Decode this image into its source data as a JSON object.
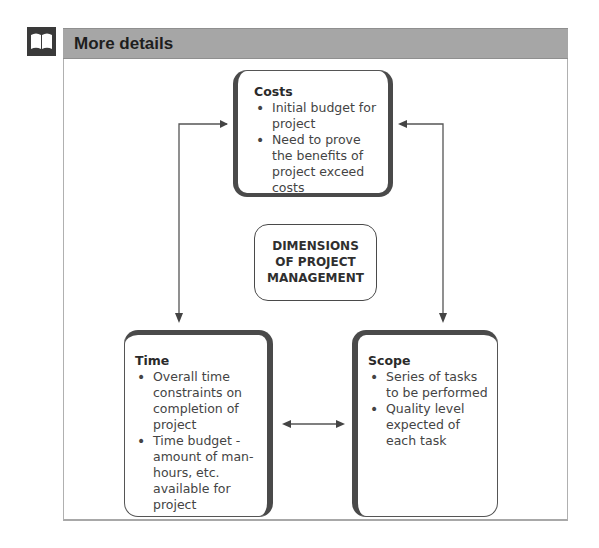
{
  "header": {
    "icon": "book-icon",
    "title": "More details",
    "bar_color": "#a6a6a6"
  },
  "diagram": {
    "center": {
      "lines": [
        "DIMENSIONS",
        "OF PROJECT",
        "MANAGEMENT"
      ]
    },
    "costs": {
      "title": "Costs",
      "bullets": [
        "Initial budget for project",
        "Need to prove the benefits of project exceed costs"
      ]
    },
    "time": {
      "title": "Time",
      "bullets": [
        "Overall time constraints on completion of project",
        "Time budget - amount of man-hours, etc. available for project"
      ]
    },
    "scope": {
      "title": "Scope",
      "bullets": [
        "Series of tasks to be performed",
        "Quality level expected of each task"
      ]
    },
    "connections": [
      {
        "from": "costs",
        "to": "time",
        "type": "double-arrow"
      },
      {
        "from": "costs",
        "to": "scope",
        "type": "double-arrow"
      },
      {
        "from": "time",
        "to": "scope",
        "type": "double-arrow"
      }
    ]
  }
}
